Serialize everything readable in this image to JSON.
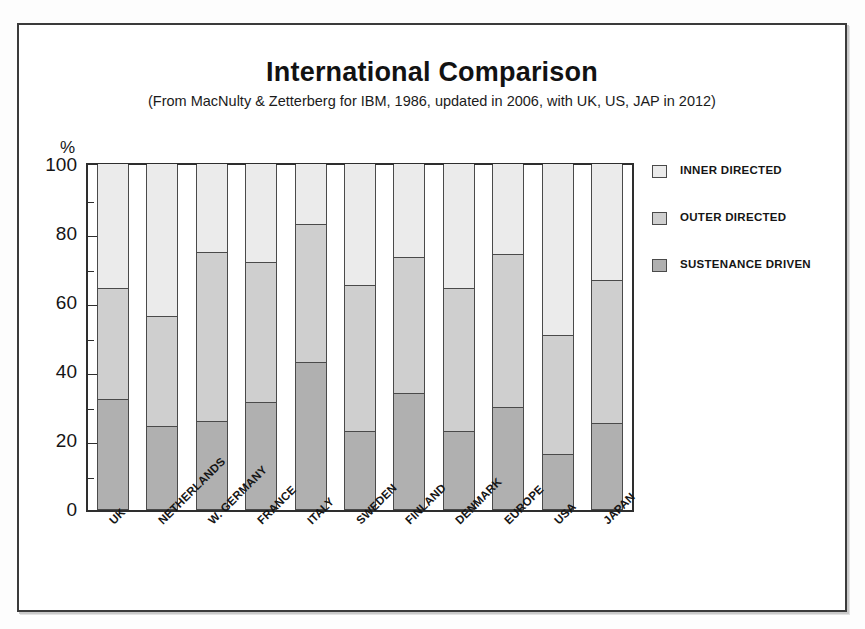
{
  "chart_data": {
    "type": "bar",
    "subtype": "stacked-bar-100",
    "title": "International Comparison",
    "subtitle": "(From MacNulty & Zetterberg for IBM, 1986, updated in 2006, with UK, US, JAP in 2012)",
    "xlabel": "",
    "ylabel": "%",
    "ylim": [
      0,
      100
    ],
    "yticks": [
      0,
      20,
      40,
      60,
      80,
      100
    ],
    "yticks_minor": [
      10,
      30,
      50,
      70,
      90
    ],
    "grid": false,
    "legend_position": "right",
    "categories": [
      "UK",
      "NETHERLANDS",
      "W. GERMANY",
      "FRANCE",
      "ITALY",
      "SWEDEN",
      "FINLAND",
      "DENMARK",
      "EUROPE",
      "USA",
      "JAPAN"
    ],
    "series": [
      {
        "name": "SUSTENANCE  DRIVEN",
        "color": "#b0b0b0",
        "values": [
          32,
          24,
          25.5,
          31,
          42.5,
          22.5,
          33.5,
          22.5,
          29.5,
          16,
          25
        ]
      },
      {
        "name": "OUTER DIRECTED",
        "color": "#cfcfcf",
        "values": [
          32,
          32,
          49,
          40.5,
          40,
          42.5,
          39.5,
          41.5,
          44.5,
          34.5,
          41.5
        ]
      },
      {
        "name": "INNER DIRECTED",
        "color": "#ebebeb",
        "values": [
          36,
          44,
          25.5,
          28.5,
          17.5,
          35,
          27,
          36,
          26,
          49.5,
          33.5
        ]
      }
    ],
    "cumulative_tops": {
      "sustenance": [
        32,
        24,
        25.5,
        31,
        42.5,
        22.5,
        33.5,
        22.5,
        29.5,
        16,
        25
      ],
      "outer": [
        64,
        56,
        74.5,
        71.5,
        82.5,
        65,
        73,
        64,
        74,
        50.5,
        66.5
      ],
      "inner": [
        100,
        100,
        100,
        100,
        100,
        100,
        100,
        100,
        100,
        100,
        100
      ]
    }
  },
  "legend": {
    "items": [
      {
        "label": "INNER DIRECTED",
        "color": "#ebebeb"
      },
      {
        "label": "OUTER DIRECTED",
        "color": "#cfcfcf"
      },
      {
        "label": "SUSTENANCE  DRIVEN",
        "color": "#b0b0b0"
      }
    ]
  },
  "axis": {
    "percent_symbol": "%",
    "y_tick_labels": [
      "100",
      "80",
      "60",
      "40",
      "20",
      "0"
    ]
  }
}
